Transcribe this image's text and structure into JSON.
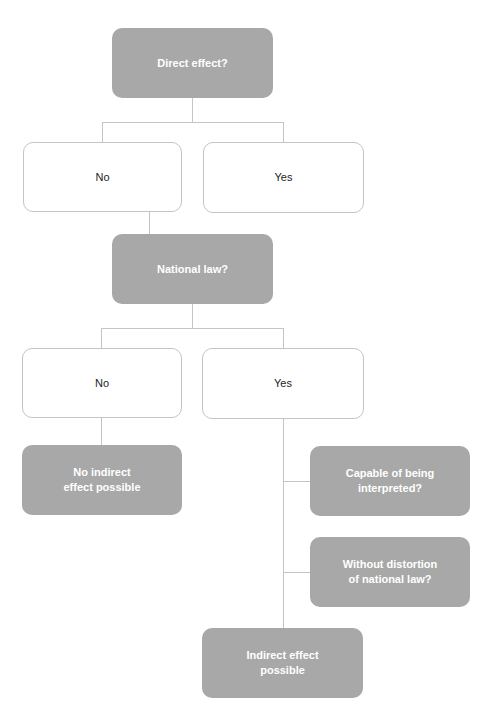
{
  "diagram": {
    "type": "flowchart",
    "colors": {
      "filled": "#a8a8a8",
      "outline": "#c4c4c4",
      "text_on_filled": "#ffffff",
      "text_on_outline": "#222222"
    },
    "nodes": {
      "direct_effect": {
        "label": "Direct effect?"
      },
      "direct_no": {
        "label": "No"
      },
      "direct_yes": {
        "label": "Yes"
      },
      "national_law": {
        "label": "National law?"
      },
      "national_no": {
        "label": "No"
      },
      "national_yes": {
        "label": "Yes"
      },
      "no_indirect": {
        "label": "No indirect effect possible"
      },
      "capable": {
        "label": "Capable of being interpreted?"
      },
      "without_distortion": {
        "label": "Without distortion of national law?"
      },
      "indirect_possible": {
        "label": "Indirect effect possible"
      }
    },
    "edges": [
      [
        "direct_effect",
        "direct_no"
      ],
      [
        "direct_effect",
        "direct_yes"
      ],
      [
        "direct_no",
        "national_law"
      ],
      [
        "national_law",
        "national_no"
      ],
      [
        "national_law",
        "national_yes"
      ],
      [
        "national_no",
        "no_indirect"
      ],
      [
        "national_yes",
        "capable"
      ],
      [
        "national_yes",
        "without_distortion"
      ],
      [
        "national_yes",
        "indirect_possible"
      ]
    ]
  }
}
